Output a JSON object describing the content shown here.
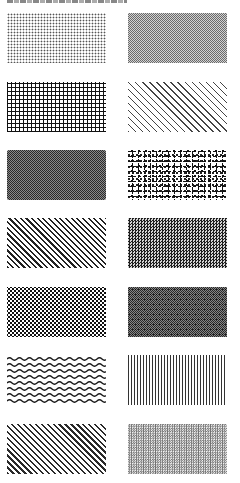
{
  "caption": {
    "text": "",
    "legible": false
  },
  "swatches": [
    {
      "row": 1,
      "column": "left",
      "pattern": "fine-dots"
    },
    {
      "row": 1,
      "column": "right",
      "pattern": "grey-stipple"
    },
    {
      "row": 2,
      "column": "left",
      "pattern": "square-grid"
    },
    {
      "row": 2,
      "column": "right",
      "pattern": "sparse-diagonal-lines"
    },
    {
      "row": 3,
      "column": "left",
      "pattern": "dark-checker"
    },
    {
      "row": 3,
      "column": "right",
      "pattern": "gravel-blobs"
    },
    {
      "row": 4,
      "column": "left",
      "pattern": "dense-diagonal-lines"
    },
    {
      "row": 4,
      "column": "right",
      "pattern": "crosshatch-checker"
    },
    {
      "row": 5,
      "column": "left",
      "pattern": "large-dots"
    },
    {
      "row": 5,
      "column": "right",
      "pattern": "random-noise"
    },
    {
      "row": 6,
      "column": "left",
      "pattern": "wavy-lines"
    },
    {
      "row": 6,
      "column": "right",
      "pattern": "vertical-lines"
    },
    {
      "row": 7,
      "column": "left",
      "pattern": "diagonal-lines"
    },
    {
      "row": 7,
      "column": "right",
      "pattern": "fine-dot-grid"
    }
  ],
  "colors": {
    "background": "#ffffff",
    "ink": "#111111"
  }
}
